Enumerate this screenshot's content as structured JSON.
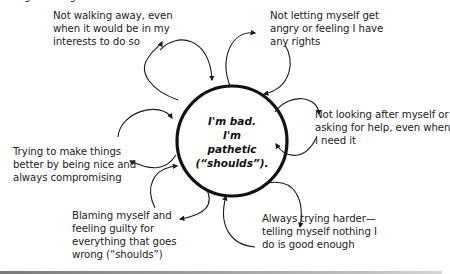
{
  "diagram": {
    "type": "cycle-diagram",
    "top_cutoff_text": "...ng ...ething...",
    "center": {
      "lines": [
        "I'm bad.",
        "I'm",
        "pathetic",
        "(“shoulds”)."
      ]
    },
    "nodes": [
      {
        "id": "not-walking-away",
        "lines": [
          "Not walking away, even",
          "when it would be in my",
          "interests to do so"
        ]
      },
      {
        "id": "not-letting-myself-angry",
        "lines": [
          "Not letting myself get",
          "angry or feeling I have",
          "any rights"
        ]
      },
      {
        "id": "not-looking-after-myself",
        "lines": [
          "Not looking after myself or",
          "asking for help, even when",
          "I need it"
        ]
      },
      {
        "id": "always-trying-harder",
        "lines": [
          "Always trying harder—",
          "telling myself nothing I",
          "do is good enough"
        ]
      },
      {
        "id": "blaming-myself",
        "lines": [
          "Blaming myself and",
          "feeling guilty for",
          "everything that goes",
          "wrong (“shoulds”)"
        ]
      },
      {
        "id": "trying-to-make-things-better",
        "lines": [
          "Trying to make things",
          "better by being nice and",
          "always compromising"
        ]
      }
    ],
    "colors": {
      "stroke": "#1a1a1a",
      "text": "#222222",
      "background": "#ffffff",
      "bottom_bar": "#8a8a8a"
    }
  }
}
